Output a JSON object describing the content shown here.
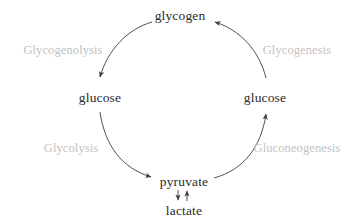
{
  "diagram": {
    "background_color": "#ffffff",
    "node_text_color": "#2b2b2b",
    "process_text_color": "#c2c2c2",
    "arrow_color": "#3d3d3d",
    "nodes": [
      {
        "id": "glycogen",
        "label": "glycogen",
        "position": "top"
      },
      {
        "id": "glucose_left",
        "label": "glucose",
        "position": "left"
      },
      {
        "id": "glucose_right",
        "label": "glucose",
        "position": "right"
      },
      {
        "id": "pyruvate",
        "label": "pyruvate",
        "position": "bottom"
      },
      {
        "id": "lactate",
        "label": "lactate",
        "position": "below-bottom"
      }
    ],
    "processes": [
      {
        "id": "glycogenolysis",
        "label": "Glycogenolysis",
        "quadrant": "top-left",
        "from": "glycogen",
        "to": "glucose_left"
      },
      {
        "id": "glycogenesis",
        "label": "Glycogenesis",
        "quadrant": "top-right",
        "from": "glucose_right",
        "to": "glycogen"
      },
      {
        "id": "glycolysis",
        "label": "Glycolysis",
        "quadrant": "bottom-left",
        "from": "glucose_left",
        "to": "pyruvate"
      },
      {
        "id": "gluconeogenesis",
        "label": "Gluconeogenesis",
        "quadrant": "bottom-right",
        "from": "pyruvate",
        "to": "glucose_right"
      }
    ],
    "reversible_pair": {
      "top": "pyruvate",
      "bottom": "lactate",
      "down_arrow": "↓",
      "up_arrow": "↑"
    }
  }
}
